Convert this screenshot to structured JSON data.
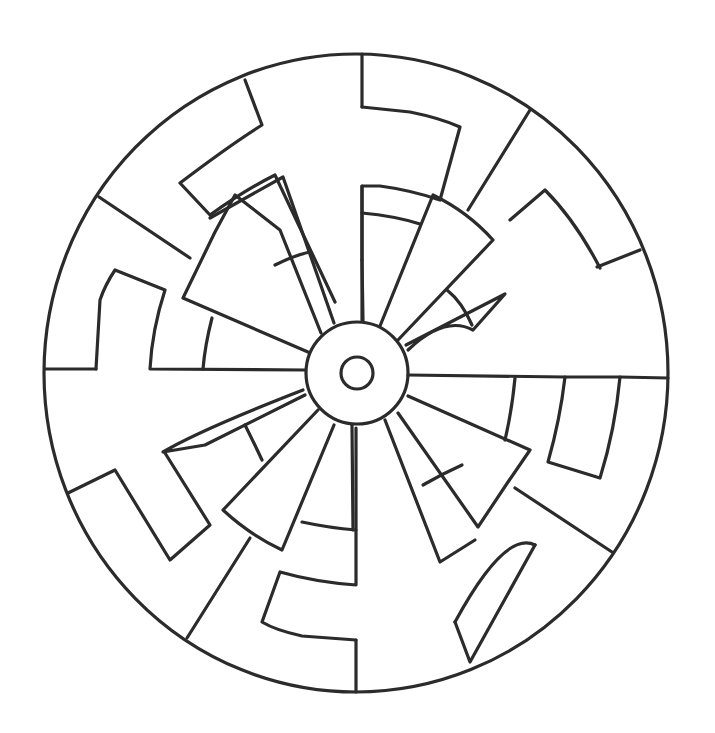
{
  "artwork": {
    "type": "coloring-page-mandala",
    "description": "Black-and-white line-art circular mandala with 12 wedge spokes around a central hub and four hooked shapes between outer dividers",
    "colors": {
      "background": "#ffffff",
      "stroke": "#2b2b2b"
    },
    "outer_circle": {
      "cx": 356,
      "cy": 373,
      "rx": 312,
      "ry": 319
    },
    "hub": {
      "cx": 357,
      "cy": 373,
      "r": 51
    },
    "inner_ring": {
      "cx": 357,
      "cy": 373,
      "r": 16
    },
    "spoke_count": 12,
    "hook_count": 4
  }
}
